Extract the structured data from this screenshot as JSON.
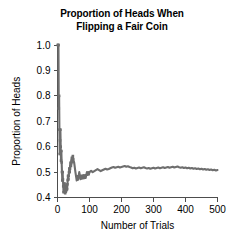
{
  "chart_data": {
    "type": "line",
    "title": "Proportion of Heads When Flipping a Fair Coin",
    "title_line1": "Proportion of Heads When",
    "title_line2": "Flipping a Fair Coin",
    "xlabel": "Number of Trials",
    "ylabel": "Proportion of Heads",
    "xlim": [
      0,
      510
    ],
    "ylim": [
      0.4,
      1.0
    ],
    "xticks": [
      0,
      100,
      200,
      300,
      400,
      500
    ],
    "xtick_labels": [
      "0",
      "100",
      "200",
      "300",
      "400",
      "500"
    ],
    "yticks": [
      0.4,
      0.5,
      0.6,
      0.7,
      0.8,
      0.9,
      1.0
    ],
    "ytick_labels": [
      "0.4",
      "0.5",
      "0.6",
      "0.7",
      "0.8",
      "0.9",
      "1.0"
    ],
    "grid": false,
    "legend": false,
    "series_color": "#6e6e6e",
    "axis_color": "#4d4d4d",
    "marker": "point",
    "series": [
      {
        "name": "Cumulative proportion of heads",
        "x": [
          1,
          2,
          3,
          4,
          5,
          6,
          7,
          8,
          9,
          10,
          11,
          12,
          13,
          14,
          15,
          16,
          17,
          18,
          19,
          20,
          21,
          22,
          23,
          24,
          25,
          26,
          27,
          28,
          29,
          30,
          31,
          32,
          33,
          34,
          35,
          36,
          37,
          38,
          39,
          40,
          41,
          42,
          43,
          44,
          45,
          46,
          47,
          48,
          49,
          50,
          52,
          54,
          56,
          58,
          60,
          62,
          64,
          66,
          68,
          70,
          72,
          74,
          76,
          78,
          80,
          82,
          84,
          86,
          88,
          90,
          92,
          94,
          96,
          98,
          100,
          105,
          110,
          115,
          120,
          125,
          130,
          135,
          140,
          145,
          150,
          155,
          160,
          165,
          170,
          175,
          180,
          185,
          190,
          195,
          200,
          205,
          210,
          215,
          220,
          225,
          230,
          235,
          240,
          245,
          250,
          255,
          260,
          265,
          270,
          275,
          280,
          285,
          290,
          295,
          300,
          305,
          310,
          315,
          320,
          325,
          330,
          335,
          340,
          345,
          350,
          355,
          360,
          365,
          370,
          375,
          380,
          385,
          390,
          395,
          400,
          405,
          410,
          415,
          420,
          425,
          430,
          435,
          440,
          445,
          450,
          455,
          460,
          465,
          470,
          475,
          480,
          485,
          490,
          495,
          500
        ],
        "y": [
          1.0,
          1.0,
          1.0,
          0.75,
          0.8,
          0.667,
          0.571,
          0.625,
          0.667,
          0.6,
          0.545,
          0.583,
          0.538,
          0.5,
          0.467,
          0.5,
          0.471,
          0.444,
          0.421,
          0.45,
          0.429,
          0.455,
          0.435,
          0.417,
          0.44,
          0.423,
          0.444,
          0.429,
          0.448,
          0.433,
          0.452,
          0.469,
          0.485,
          0.471,
          0.486,
          0.5,
          0.514,
          0.5,
          0.513,
          0.525,
          0.537,
          0.524,
          0.535,
          0.545,
          0.556,
          0.543,
          0.553,
          0.563,
          0.551,
          0.54,
          0.538,
          0.519,
          0.5,
          0.483,
          0.467,
          0.484,
          0.469,
          0.485,
          0.5,
          0.486,
          0.472,
          0.486,
          0.474,
          0.487,
          0.475,
          0.488,
          0.476,
          0.488,
          0.477,
          0.489,
          0.5,
          0.489,
          0.5,
          0.49,
          0.5,
          0.505,
          0.5,
          0.504,
          0.508,
          0.512,
          0.508,
          0.504,
          0.507,
          0.51,
          0.513,
          0.51,
          0.512,
          0.515,
          0.518,
          0.52,
          0.517,
          0.519,
          0.521,
          0.518,
          0.52,
          0.522,
          0.524,
          0.521,
          0.523,
          0.52,
          0.518,
          0.515,
          0.517,
          0.514,
          0.516,
          0.518,
          0.515,
          0.517,
          0.519,
          0.516,
          0.514,
          0.516,
          0.513,
          0.515,
          0.517,
          0.514,
          0.516,
          0.518,
          0.515,
          0.517,
          0.519,
          0.516,
          0.518,
          0.52,
          0.517,
          0.519,
          0.521,
          0.518,
          0.52,
          0.522,
          0.519,
          0.517,
          0.519,
          0.516,
          0.518,
          0.515,
          0.517,
          0.514,
          0.516,
          0.513,
          0.515,
          0.512,
          0.514,
          0.511,
          0.513,
          0.51,
          0.512,
          0.509,
          0.511,
          0.508,
          0.51,
          0.507,
          0.509,
          0.506,
          0.508
        ]
      }
    ]
  }
}
